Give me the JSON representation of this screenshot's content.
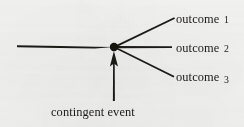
{
  "figure": {
    "type": "node-branch-diagram",
    "background_color": "#f4f4f2",
    "ink_color": "#1c1a19",
    "node": {
      "name": "contingent-event-node",
      "shape": "filled-circle",
      "x": 114,
      "y": 47,
      "radius": 4.2
    },
    "incoming_line": {
      "label": "",
      "from_x": 17,
      "from_y": 46,
      "to_x": 114,
      "to_y": 47
    },
    "branches": [
      {
        "id": "branch-1",
        "label": "outcome",
        "number": "1",
        "from_x": 114,
        "from_y": 47,
        "to_x": 174,
        "to_y": 18
      },
      {
        "id": "branch-2",
        "label": "outcome",
        "number": "2",
        "from_x": 114,
        "from_y": 47,
        "to_x": 172,
        "to_y": 47
      },
      {
        "id": "branch-3",
        "label": "outcome",
        "number": "3",
        "from_x": 114,
        "from_y": 47,
        "to_x": 174,
        "to_y": 77
      }
    ],
    "arrow": {
      "name": "contingent-event-arrow",
      "direction": "up",
      "tail_x": 114,
      "tail_y": 101,
      "head_x": 114,
      "head_y": 52
    },
    "labels": {
      "outcome_1": "outcome",
      "outcome_1_number": "1",
      "outcome_2": "outcome",
      "outcome_2_number": "2",
      "outcome_3": "outcome",
      "outcome_3_number": "3",
      "contingent_event": "contingent event"
    }
  }
}
